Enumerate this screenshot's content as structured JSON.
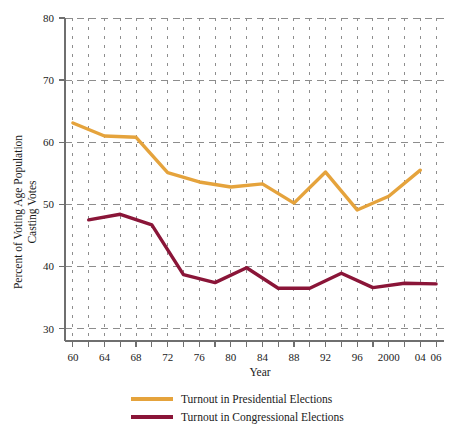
{
  "chart_data": {
    "type": "line",
    "title": "",
    "xlabel": "Year",
    "ylabel": "Percent of Voting Age Population Casting Votes",
    "ylabel_line1": "Percent of Voting Age Population",
    "ylabel_line2": "Casting Votes",
    "xlim": [
      59,
      107
    ],
    "ylim": [
      28,
      80
    ],
    "grid": true,
    "legend_position": "bottom",
    "ytick_labels": [
      "80",
      "70",
      "60",
      "50",
      "40",
      "30"
    ],
    "yticks": [
      80,
      70,
      60,
      50,
      40,
      30
    ],
    "xtick_labels": [
      "60",
      "64",
      "68",
      "72",
      "76",
      "80",
      "84",
      "88",
      "92",
      "96",
      "2000",
      "04",
      "06"
    ],
    "xticks": [
      60,
      64,
      68,
      72,
      76,
      80,
      84,
      88,
      92,
      96,
      100,
      104,
      106
    ],
    "x_minor_step": 2,
    "series": [
      {
        "name": "Turnout in Presidential Elections",
        "color": "#E5A33C",
        "x": [
          60,
          64,
          68,
          72,
          76,
          80,
          84,
          88,
          92,
          96,
          100,
          104
        ],
        "values": [
          63.1,
          61.0,
          60.8,
          55.1,
          53.6,
          52.8,
          53.3,
          50.2,
          55.2,
          49.1,
          51.3,
          55.5
        ]
      },
      {
        "name": "Turnout in Congressional Elections",
        "color": "#8A1538",
        "x": [
          62,
          66,
          70,
          74,
          78,
          82,
          86,
          90,
          94,
          98,
          102,
          106
        ],
        "values": [
          47.5,
          48.4,
          46.7,
          38.7,
          37.4,
          39.8,
          36.5,
          36.5,
          38.9,
          36.6,
          37.3,
          37.2
        ]
      }
    ]
  },
  "legend": {
    "items": [
      {
        "label": "Turnout in Presidential Elections",
        "color": "#E5A33C"
      },
      {
        "label": "Turnout in Congressional Elections",
        "color": "#8A1538"
      }
    ]
  }
}
